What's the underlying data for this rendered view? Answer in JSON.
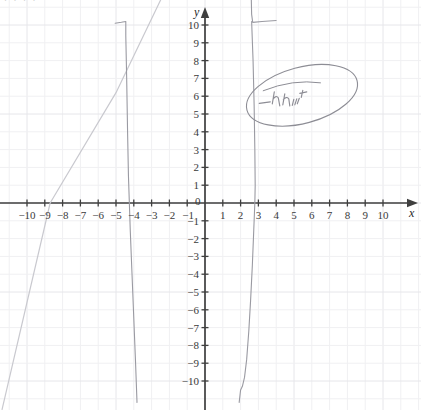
{
  "page": {
    "kind": "hand-annotated-graph-screenshot",
    "width": 421,
    "height": 410,
    "background": "#ffffff",
    "top_cropped_text": "· ·  ·   ·"
  },
  "colors": {
    "grid_minor": "#f0f0f2",
    "grid_major": "#e6e6ea",
    "axis": "#3f3f3f",
    "tick_text": "#3a3a3a",
    "curve": "#9a9aa2",
    "line": "#c9c9cf",
    "annotation": "#8d8d95"
  },
  "axes": {
    "x_name": "x",
    "y_name": "y",
    "x_ticks_negative": [
      "-10",
      "-9",
      "-8",
      "-7",
      "-6",
      "-5",
      "-4",
      "-3",
      "-2",
      "-1"
    ],
    "x_ticks_positive": [
      "1",
      "2",
      "3",
      "4",
      "5",
      "6",
      "7",
      "8",
      "9",
      "10"
    ],
    "y_ticks_positive": [
      "1",
      "2",
      "3",
      "4",
      "5",
      "6",
      "7",
      "8",
      "9",
      "10"
    ],
    "y_ticks_negative": [
      "-1",
      "-2",
      "-3",
      "-4",
      "-5",
      "-6",
      "-7",
      "-8",
      "-9",
      "-10"
    ],
    "origin_label": "0"
  },
  "annotation": {
    "text": "-In hunt",
    "shape": "ellipse",
    "underline": true
  },
  "chart_data": {
    "type": "line",
    "title": "",
    "subtitle": "",
    "xlabel": "x",
    "ylabel": "y",
    "xlim": [
      -11,
      11
    ],
    "ylim": [
      -11,
      11
    ],
    "grid": true,
    "grid_step": 1,
    "legend": "none",
    "origin_px": [
      205,
      203
    ],
    "unit_px": 17.8,
    "series": [
      {
        "name": "straight-line",
        "style": "solid-light",
        "color": "#c9c9cf",
        "points": [
          [
            -11.4,
            -11.6
          ],
          [
            -8.7,
            0
          ],
          [
            -5.0,
            6.2
          ],
          [
            -2.4,
            11.6
          ]
        ]
      },
      {
        "name": "branch-left",
        "style": "solid",
        "color": "#9a9aa2",
        "points": [
          [
            -5.05,
            10.1
          ],
          [
            -4.7,
            10.15
          ],
          [
            -4.45,
            10.2
          ],
          [
            -4.45,
            9.4
          ],
          [
            -4.4,
            7.0
          ],
          [
            -4.35,
            4.0
          ],
          [
            -4.3,
            1.5
          ],
          [
            -4.25,
            0.0
          ],
          [
            -4.2,
            -1.5
          ],
          [
            -4.1,
            -4.0
          ],
          [
            -4.0,
            -6.5
          ],
          [
            -3.9,
            -9.0
          ],
          [
            -3.82,
            -11.2
          ]
        ]
      },
      {
        "name": "branch-right",
        "style": "solid",
        "color": "#9a9aa2",
        "points": [
          [
            2.6,
            11.5
          ],
          [
            2.62,
            10.6
          ],
          [
            2.68,
            10.15
          ],
          [
            3.2,
            10.2
          ],
          [
            4.0,
            10.25
          ]
        ]
      },
      {
        "name": "branch-right-descending",
        "style": "solid",
        "color": "#9a9aa2",
        "points": [
          [
            2.62,
            10.2
          ],
          [
            2.7,
            8.0
          ],
          [
            2.76,
            5.5
          ],
          [
            2.8,
            3.0
          ],
          [
            2.82,
            1.0
          ],
          [
            2.8,
            0.0
          ],
          [
            2.74,
            -1.5
          ],
          [
            2.66,
            -3.5
          ],
          [
            2.56,
            -5.5
          ],
          [
            2.46,
            -7.2
          ],
          [
            2.34,
            -8.8
          ],
          [
            2.22,
            -9.8
          ],
          [
            2.1,
            -10.3
          ],
          [
            2.0,
            -10.5
          ],
          [
            1.92,
            -11.2
          ]
        ]
      }
    ]
  }
}
